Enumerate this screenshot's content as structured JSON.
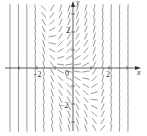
{
  "chart_data": {
    "type": "slope_field",
    "title": "",
    "xlabel": "x",
    "ylabel": "y",
    "x_ticks": [
      {
        "value": -2,
        "label": "−2"
      },
      {
        "value": 0,
        "label": "0"
      },
      {
        "value": 2,
        "label": "2"
      }
    ],
    "y_ticks": [
      {
        "value": 2,
        "label": "2"
      },
      {
        "value": -2,
        "label": "−2"
      }
    ],
    "xlim": [
      -3,
      3
    ],
    "ylim": [
      -3.6,
      3.6
    ],
    "grid": false,
    "legend": null,
    "field": {
      "equation_estimate": "dy/dx = x^3 + y",
      "x_samples": 15,
      "y_samples": 18,
      "segment_color": "#555555"
    }
  },
  "labels": {
    "x_axis": "x",
    "y_axis": "y",
    "origin": "0",
    "x_neg2": "−2",
    "x_pos2": "2",
    "y_pos2": "2",
    "y_neg2": "−2"
  }
}
